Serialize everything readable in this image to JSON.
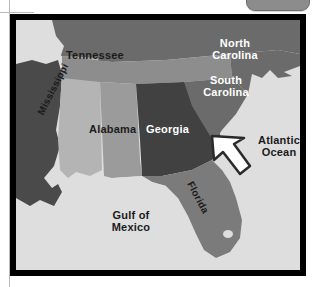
{
  "page": {
    "chrome": {
      "tab_name": "rounded-tab-control"
    }
  },
  "map": {
    "title": "Southeastern United States",
    "water_color": "#dedede",
    "frame_color": "#000000",
    "regions": [
      {
        "name": "tennessee",
        "label": "Tennessee",
        "fill": "#8d8d8d",
        "label_color": "#1b1b1b"
      },
      {
        "name": "north-carolina",
        "label": "North\nCarolina",
        "fill": "#6b6b6b",
        "label_color": "#ffffff"
      },
      {
        "name": "south-carolina",
        "label": "South\nCarolina",
        "fill": "#6b6b6b",
        "label_color": "#ffffff"
      },
      {
        "name": "georgia",
        "label": "Georgia",
        "fill": "#414141",
        "label_color": "#ffffff"
      },
      {
        "name": "alabama",
        "label": "Alabama",
        "fill": "#9b9b9b",
        "label_color": "#1b1b1b"
      },
      {
        "name": "mississippi",
        "label": "Mississippi",
        "fill": "#b4b4b4",
        "label_color": "#1b1b1b"
      },
      {
        "name": "florida",
        "label": "Florida",
        "fill": "#7b7b7b",
        "label_color": "#1b1b1b"
      },
      {
        "name": "kentucky-virginia",
        "label": "",
        "fill": "#6b6b6b",
        "label_color": "#1b1b1b"
      },
      {
        "name": "arkansas-louisiana",
        "label": "",
        "fill": "#4a4a4a",
        "label_color": "#1b1b1b"
      }
    ],
    "water_labels": [
      {
        "name": "gulf-of-mexico",
        "label": "Gulf of\nMexico",
        "label_color": "#1b1b1b"
      },
      {
        "name": "atlantic-ocean",
        "label": "Atlantic\nOcean",
        "label_color": "#1b1b1b"
      }
    ],
    "annotation": {
      "name": "pointer-arrow",
      "description": "white arrow pointing up-left at the Georgia / South Carolina coast",
      "fill": "#ffffff",
      "stroke": "#2a2a2a"
    }
  }
}
